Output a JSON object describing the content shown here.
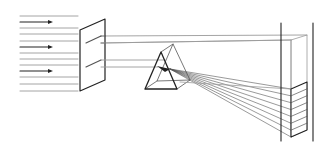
{
  "diagram": {
    "colors": {
      "line": "#555555",
      "dark": "#222222",
      "light": "#9a9a9a",
      "background": "#ffffff"
    },
    "incoming_rays": {
      "y": [
        16,
        22,
        28,
        34,
        41,
        47,
        53,
        59,
        65,
        71,
        77,
        84,
        91
      ],
      "arrow_rows": [
        22,
        47,
        71
      ],
      "x_start": 20,
      "x_end": 78
    },
    "slit_screen": {
      "polygon": [
        [
          80,
          30
        ],
        [
          105,
          19
        ],
        [
          105,
          80
        ],
        [
          80,
          91
        ]
      ],
      "slits": [
        [
          [
            86,
            43
          ],
          [
            101,
            36
          ]
        ],
        [
          [
            86,
            67
          ],
          [
            101,
            60
          ]
        ]
      ]
    },
    "beams": {
      "upper": [
        [
          [
            101,
            36
          ],
          [
            307,
            35
          ]
        ],
        [
          [
            101,
            43
          ],
          [
            291,
            40
          ]
        ]
      ],
      "lower": [
        [
          [
            101,
            60
          ],
          [
            165,
            60
          ]
        ],
        [
          [
            101,
            67
          ],
          [
            158,
            67
          ]
        ]
      ]
    },
    "prism": {
      "front": [
        [
          161,
          52
        ],
        [
          145,
          89
        ],
        [
          177,
          89
        ]
      ],
      "back": [
        [
          173,
          44
        ],
        [
          157,
          81
        ],
        [
          190,
          80
        ]
      ]
    },
    "spectrum": {
      "origin": [
        170,
        69
      ],
      "count": 8,
      "top_y_front": 89,
      "bottom_y_front": 137,
      "x_front": 291
    },
    "projection_screen": {
      "left_line_x": 281,
      "right_line_x": 313,
      "y_top": 23,
      "y_bottom": 141
    }
  }
}
